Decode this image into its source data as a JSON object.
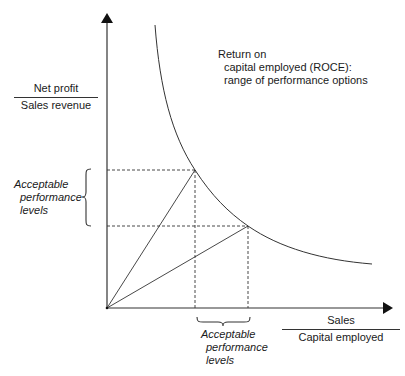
{
  "diagram": {
    "title_lines": [
      "Return on",
      "capital employed (ROCE):",
      "range of performance options"
    ],
    "y_axis": {
      "numerator": "Net profit",
      "denominator": "Sales revenue"
    },
    "x_axis": {
      "numerator": "Sales",
      "denominator": "Capital employed"
    },
    "y_range_label": [
      "Acceptable",
      "performance",
      "levels"
    ],
    "x_range_label": [
      "Acceptable",
      "performance",
      "levels"
    ],
    "colors": {
      "line": "#333333",
      "text": "#1a1a1a",
      "background": "#ffffff"
    },
    "geometry": {
      "origin": [
        107,
        308
      ],
      "curve": "iso-ROCE hyperbola",
      "point_a": [
        195,
        170
      ],
      "point_b": [
        248,
        226
      ]
    }
  }
}
